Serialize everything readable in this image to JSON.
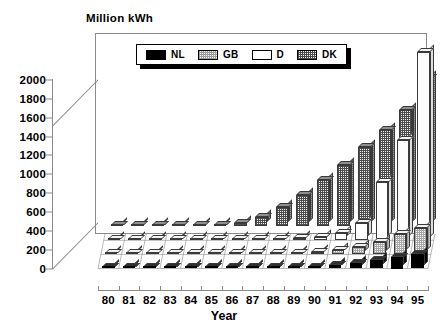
{
  "chart_data": {
    "type": "bar",
    "title": "",
    "ylabel": "Million kWh",
    "xlabel": "Year",
    "ylim": [
      0,
      2000
    ],
    "yticks": [
      0,
      200,
      400,
      600,
      800,
      1000,
      1200,
      1400,
      1600,
      1800,
      2000
    ],
    "grid": false,
    "legend_position": "top-center",
    "projection": "3d-grouped-rows",
    "categories": [
      "80",
      "81",
      "82",
      "83",
      "84",
      "85",
      "86",
      "87",
      "88",
      "89",
      "90",
      "91",
      "92",
      "93",
      "94",
      "95"
    ],
    "series": [
      {
        "name": "NL",
        "fill": "solid-black",
        "values": [
          0,
          0,
          0,
          0,
          0,
          0,
          0,
          2,
          5,
          10,
          20,
          35,
          60,
          85,
          125,
          155
        ]
      },
      {
        "name": "GB",
        "fill": "light-checker",
        "values": [
          0,
          0,
          0,
          0,
          0,
          0,
          0,
          3,
          8,
          15,
          25,
          45,
          80,
          135,
          215,
          280
        ]
      },
      {
        "name": "D",
        "fill": "white",
        "values": [
          0,
          0,
          0,
          0,
          0,
          0,
          0,
          5,
          12,
          22,
          40,
          75,
          180,
          620,
          1060,
          2000
        ]
      },
      {
        "name": "DK",
        "fill": "dark-checker",
        "values": [
          0,
          0,
          0,
          5,
          10,
          18,
          30,
          100,
          200,
          330,
          490,
          650,
          840,
          1020,
          1230,
          1570
        ]
      }
    ]
  },
  "legend": {
    "items": [
      {
        "label": "NL",
        "swatch": "solid-black-swatch"
      },
      {
        "label": "GB",
        "swatch": "light-checker-swatch"
      },
      {
        "label": "D",
        "swatch": "white-swatch"
      },
      {
        "label": "DK",
        "swatch": "dark-checker-swatch"
      }
    ]
  },
  "axes": {
    "y_title": "Million kWh",
    "x_title": "Year"
  }
}
